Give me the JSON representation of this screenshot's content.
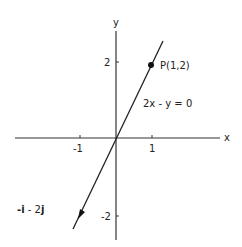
{
  "axes": {
    "x_label": "x",
    "y_label": "y",
    "x_ticks": [
      {
        "value": -1,
        "label": "-1"
      },
      {
        "value": 1,
        "label": "1"
      }
    ],
    "y_ticks": [
      {
        "value": 2,
        "label": "2"
      },
      {
        "value": -2,
        "label": "-2"
      }
    ]
  },
  "line": {
    "equation_label": "2x - y = 0",
    "slope": 2
  },
  "point": {
    "label": "P(1,2)",
    "x": 1,
    "y": 2
  },
  "vector": {
    "label_parts": [
      "-",
      "i",
      " - 2",
      "j"
    ],
    "label": "-i - 2j",
    "direction": [
      -1,
      -2
    ]
  },
  "colors": {
    "stroke": "#222222",
    "background": "#ffffff"
  }
}
